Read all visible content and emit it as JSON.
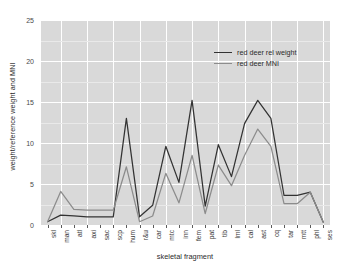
{
  "chart_data": {
    "type": "line",
    "title": "",
    "xlabel": "skeletal fragment",
    "ylabel": "weight/reference weight and MNI",
    "ylim": [
      0,
      25
    ],
    "yticks": [
      0,
      5,
      10,
      15,
      20,
      25
    ],
    "grid": true,
    "legend_position": "top-right",
    "categories": [
      "skl",
      "man",
      "atl",
      "axi",
      "sac",
      "scp",
      "hum",
      "r&u",
      "car",
      "mtc",
      "inn",
      "fem",
      "pat",
      "tib",
      "lml",
      "cal",
      "ast",
      "cq",
      "tar",
      "mtt",
      "phl",
      "ses"
    ],
    "series": [
      {
        "name": "red deer rel weight",
        "color": "#333333",
        "values": [
          0.4,
          1.2,
          1.1,
          1.0,
          1.0,
          1.0,
          13.0,
          1.0,
          2.4,
          9.6,
          5.2,
          15.2,
          2.3,
          9.8,
          5.9,
          12.4,
          15.2,
          13.0,
          3.6,
          3.6,
          4.0,
          0.3
        ]
      },
      {
        "name": "red deer MNI",
        "color": "#8c8c8c",
        "values": [
          0.4,
          4.1,
          1.9,
          1.8,
          1.8,
          1.8,
          7.1,
          0.4,
          1.1,
          6.3,
          2.7,
          8.5,
          1.4,
          7.3,
          4.8,
          8.5,
          11.7,
          9.6,
          2.6,
          2.6,
          4.0,
          0.3
        ]
      }
    ]
  },
  "legend": {
    "entries": [
      {
        "label": "red deer rel weight"
      },
      {
        "label": "red deer MNI"
      }
    ]
  }
}
